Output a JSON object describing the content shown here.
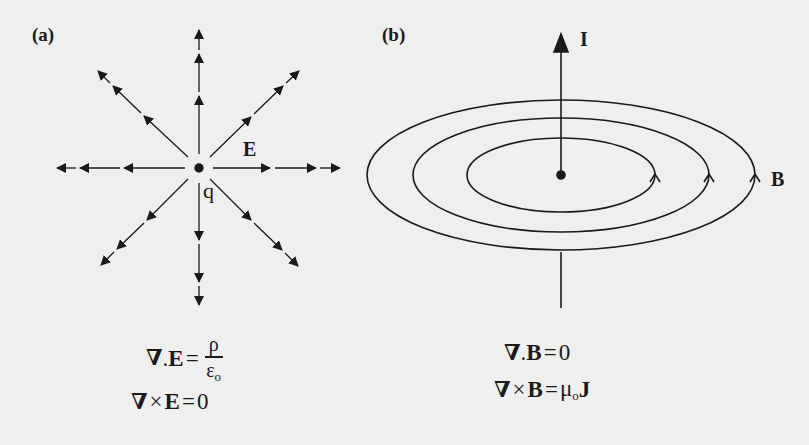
{
  "panel_a": {
    "label": "(a)",
    "field_label": "E",
    "charge_label": "q",
    "equation_1": {
      "lhs_operator": "∇",
      "dot": ".",
      "field": "E",
      "equals": "=",
      "numerator": "ρ",
      "denominator": "ε",
      "denominator_sub": "o"
    },
    "equation_2": {
      "lhs_operator": "∇",
      "cross": "×",
      "field": "E",
      "equals": "=",
      "rhs": "0"
    }
  },
  "panel_b": {
    "label": "(b)",
    "current_label": "I",
    "field_label": "B",
    "equation_1": {
      "lhs_operator": "∇",
      "dot": ".",
      "field": "B",
      "equals": "=",
      "rhs": "0"
    },
    "equation_2": {
      "lhs_operator": "∇",
      "cross": "×",
      "field": "B",
      "equals": "=",
      "rhs_coef": "μ",
      "rhs_coef_sub": "o",
      "rhs_field": "J"
    }
  },
  "colors": {
    "background": "#efefed",
    "ink": "#1a1a1a"
  }
}
